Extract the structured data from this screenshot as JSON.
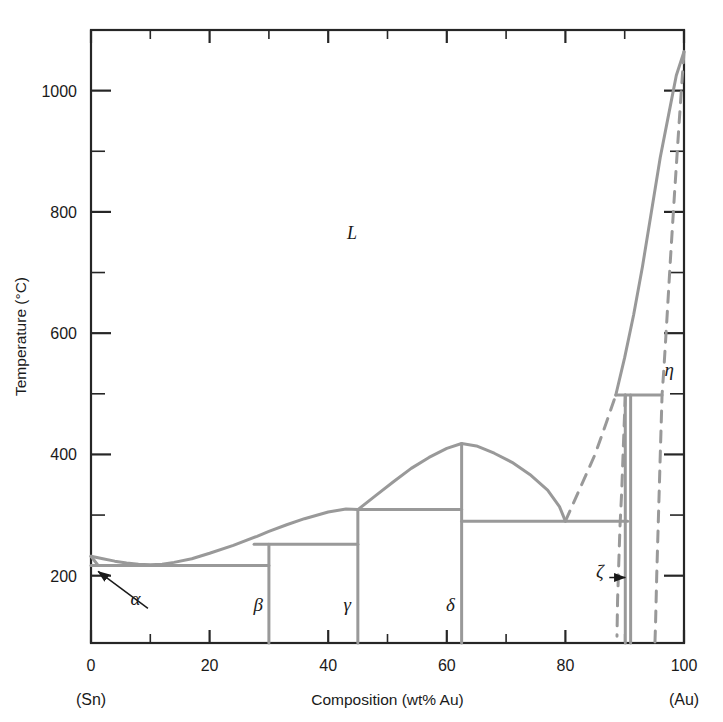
{
  "figure": {
    "title": "",
    "axes": {
      "x": {
        "label": "Composition (wt% Au)",
        "min": 0,
        "max": 100,
        "major_ticks": [
          0,
          20,
          40,
          60,
          80,
          100
        ],
        "minor_ticks": [
          10,
          30,
          50,
          70,
          90
        ],
        "tick_labels": [
          "0",
          "20",
          "40",
          "60",
          "80",
          "100"
        ],
        "left_endpoint": "(Sn)",
        "right_endpoint": "(Au)"
      },
      "y": {
        "label": "Temperature (°C)",
        "min": 89,
        "max": 1100,
        "major_ticks": [
          200,
          400,
          600,
          800,
          1000
        ],
        "minor_ticks": [
          300,
          500,
          700,
          900,
          1100
        ],
        "tick_labels": [
          "200",
          "400",
          "600",
          "800",
          "1000"
        ]
      }
    },
    "phase_labels": [
      {
        "name": "liquid",
        "text": "L",
        "x": 44,
        "y": 755,
        "italic": true
      },
      {
        "name": "alpha",
        "text": "α",
        "x": 7.5,
        "y": 152,
        "italic": true
      },
      {
        "name": "beta",
        "text": "β",
        "x": 28.2,
        "y": 142,
        "italic": true
      },
      {
        "name": "gamma",
        "text": "γ",
        "x": 43.2,
        "y": 142,
        "italic": true
      },
      {
        "name": "delta",
        "text": "δ",
        "x": 60.6,
        "y": 142,
        "italic": true
      },
      {
        "name": "zeta",
        "text": "ζ",
        "x": 85.8,
        "y": 196,
        "italic": true
      },
      {
        "name": "eta",
        "text": "η",
        "x": 97.5,
        "y": 530,
        "italic": true
      }
    ],
    "arrows": [
      {
        "name": "alpha-arrow",
        "from_x": 9.6,
        "from_y": 146,
        "to_x": 1.2,
        "to_y": 207
      },
      {
        "name": "zeta-arrow",
        "from_x": 87.4,
        "from_y": 197,
        "to_x": 90.1,
        "to_y": 197
      }
    ]
  },
  "chart_data": {
    "type": "line",
    "xlabel": "Composition (wt% Au)",
    "ylabel": "Temperature (°C)",
    "xlim": [
      0,
      100
    ],
    "ylim": [
      89,
      1100
    ],
    "grid": false,
    "legend": "none",
    "line_color": "#999999",
    "axis_color": "#262626",
    "invariant_temperatures": {
      "sn_eutectic": 217,
      "beta_peritectic": 252,
      "gamma_peritectic": 309,
      "delta_peritectic": 290,
      "zeta_peritectic": 498
    },
    "series": [
      {
        "name": "liquidus-sn-side",
        "style": "solid",
        "points": [
          [
            0,
            232
          ],
          [
            2,
            228
          ],
          [
            4,
            224
          ],
          [
            6,
            221
          ],
          [
            8,
            219
          ],
          [
            10,
            218
          ],
          [
            12,
            219
          ],
          [
            14,
            222
          ],
          [
            17,
            228
          ],
          [
            20,
            237
          ],
          [
            24,
            250
          ],
          [
            28,
            265
          ],
          [
            30,
            273
          ],
          [
            33,
            284
          ],
          [
            36,
            294
          ],
          [
            40,
            305
          ],
          [
            43,
            310
          ],
          [
            45,
            309
          ]
        ]
      },
      {
        "name": "liquidus-delta-dome",
        "style": "solid",
        "points": [
          [
            45,
            309
          ],
          [
            48,
            332
          ],
          [
            51,
            355
          ],
          [
            54,
            377
          ],
          [
            57,
            395
          ],
          [
            60,
            410
          ],
          [
            62.5,
            418
          ],
          [
            65,
            414
          ],
          [
            68,
            402
          ],
          [
            71,
            387
          ],
          [
            74,
            367
          ],
          [
            77,
            341
          ],
          [
            79,
            314
          ],
          [
            80,
            290
          ]
        ]
      },
      {
        "name": "liquidus-au-side",
        "style": "solid",
        "points": [
          [
            88.5,
            498
          ],
          [
            90,
            560
          ],
          [
            91.5,
            630
          ],
          [
            93,
            710
          ],
          [
            94.5,
            800
          ],
          [
            96,
            890
          ],
          [
            97.5,
            965
          ],
          [
            98.7,
            1025
          ],
          [
            100,
            1064
          ]
        ]
      },
      {
        "name": "sn-solidus-left",
        "style": "solid",
        "points": [
          [
            0,
            232
          ],
          [
            1.2,
            217
          ]
        ]
      },
      {
        "name": "eutectic-line-217",
        "style": "solid",
        "points": [
          [
            0,
            217
          ],
          [
            30,
            217
          ]
        ]
      },
      {
        "name": "peritectic-line-252",
        "style": "solid",
        "points": [
          [
            27.5,
            252
          ],
          [
            45,
            252
          ]
        ]
      },
      {
        "name": "peritectic-line-309",
        "style": "solid",
        "points": [
          [
            45,
            309
          ],
          [
            62.5,
            309
          ]
        ]
      },
      {
        "name": "peritectic-line-290",
        "style": "solid",
        "points": [
          [
            62.5,
            290
          ],
          [
            80,
            290
          ],
          [
            90.5,
            290
          ]
        ]
      },
      {
        "name": "peritectic-line-498",
        "style": "solid",
        "points": [
          [
            88.5,
            498
          ],
          [
            96.3,
            498
          ]
        ]
      },
      {
        "name": "beta-boundary",
        "style": "solid",
        "points": [
          [
            30,
            252
          ],
          [
            30,
            89
          ]
        ]
      },
      {
        "name": "gamma-boundary",
        "style": "solid",
        "points": [
          [
            45,
            309
          ],
          [
            45,
            89
          ]
        ]
      },
      {
        "name": "delta-boundary",
        "style": "solid",
        "points": [
          [
            62.5,
            418
          ],
          [
            62.5,
            89
          ]
        ]
      },
      {
        "name": "zeta-boundary-left",
        "style": "solid",
        "points": [
          [
            90.1,
            498
          ],
          [
            90.1,
            89
          ]
        ]
      },
      {
        "name": "zeta-boundary-right",
        "style": "solid",
        "points": [
          [
            91.0,
            498
          ],
          [
            91.0,
            89
          ]
        ]
      },
      {
        "name": "eta-solvus-dashed",
        "style": "dashed",
        "points": [
          [
            100,
            1064
          ],
          [
            99.2,
            950
          ],
          [
            98.4,
            830
          ],
          [
            97.7,
            720
          ],
          [
            97.1,
            620
          ],
          [
            96.6,
            540
          ],
          [
            96.3,
            498
          ],
          [
            96.0,
            400
          ],
          [
            95.7,
            300
          ],
          [
            95.4,
            200
          ],
          [
            95.2,
            120
          ],
          [
            95.1,
            89
          ]
        ]
      },
      {
        "name": "au-liquidus-dashed-lower",
        "style": "dashed",
        "points": [
          [
            80,
            290
          ],
          [
            82.5,
            345
          ],
          [
            85,
            400
          ],
          [
            87,
            455
          ],
          [
            88.5,
            498
          ]
        ]
      },
      {
        "name": "zeta-solvus-dashed",
        "style": "dashed",
        "points": [
          [
            90.1,
            498
          ],
          [
            89.8,
            420
          ],
          [
            89.5,
            340
          ],
          [
            89.2,
            280
          ],
          [
            89.0,
            220
          ],
          [
            88.8,
            160
          ],
          [
            88.7,
            100
          ]
        ]
      }
    ]
  }
}
